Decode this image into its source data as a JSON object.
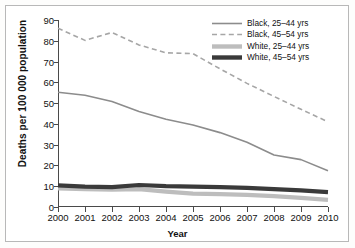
{
  "chart_data": {
    "type": "line",
    "title": "",
    "xlabel": "Year",
    "ylabel": "Deaths per 100 000 population",
    "x": [
      2000,
      2001,
      2002,
      2003,
      2004,
      2005,
      2006,
      2007,
      2008,
      2009,
      2010
    ],
    "xticklabels": [
      "2000",
      "2001",
      "2002",
      "2003",
      "2004",
      "2005",
      "2006",
      "2007",
      "2008",
      "2009",
      "2010"
    ],
    "yticklabels": [
      "0",
      "10",
      "20",
      "30",
      "40",
      "50",
      "60",
      "70",
      "80",
      "90"
    ],
    "yticks": [
      0,
      10,
      20,
      30,
      40,
      50,
      60,
      70,
      80,
      90
    ],
    "xlim": [
      2000,
      2010
    ],
    "ylim": [
      0,
      90
    ],
    "grid": false,
    "legend_position": "top-right",
    "series": [
      {
        "name": "Black, 25–44 yrs",
        "style": "solid",
        "color": "#8c8c8c",
        "width": 1.6,
        "values": [
          55.2,
          53.8,
          50.8,
          46.0,
          42.2,
          39.5,
          35.8,
          31.2,
          25.0,
          22.8,
          17.4
        ]
      },
      {
        "name": "Black, 45–54 yrs",
        "style": "dashed",
        "color": "#a6a6a6",
        "width": 1.6,
        "values": [
          86.0,
          80.2,
          84.0,
          78.0,
          74.2,
          73.8,
          66.5,
          59.5,
          53.2,
          47.0,
          41.0
        ]
      },
      {
        "name": "White, 25–44 yrs",
        "style": "thick-gray",
        "color": "#bdbdbd",
        "width": 4.2,
        "values": [
          9.0,
          8.6,
          8.4,
          8.6,
          7.4,
          6.4,
          6.2,
          5.8,
          5.2,
          4.4,
          3.4
        ]
      },
      {
        "name": "White, 45–54 yrs",
        "style": "thick-dark",
        "color": "#3a3a3a",
        "width": 4.2,
        "values": [
          10.4,
          9.8,
          9.6,
          10.6,
          10.0,
          9.8,
          9.6,
          9.2,
          8.6,
          8.0,
          7.2
        ]
      }
    ]
  },
  "legend": {
    "items": [
      {
        "label": "Black, 25–44 yrs",
        "style": "solid",
        "color": "#8c8c8c"
      },
      {
        "label": "Black, 45–54 yrs",
        "style": "dashed",
        "color": "#a6a6a6"
      },
      {
        "label": "White, 25–44 yrs",
        "style": "thick-gray",
        "color": "#bdbdbd"
      },
      {
        "label": "White, 45–54 yrs",
        "style": "thick-dark",
        "color": "#3a3a3a"
      }
    ]
  },
  "colors": {
    "axis": "#4a4a4a",
    "text": "#111111",
    "frame": "#b8b8b8",
    "background": "#ffffff"
  }
}
